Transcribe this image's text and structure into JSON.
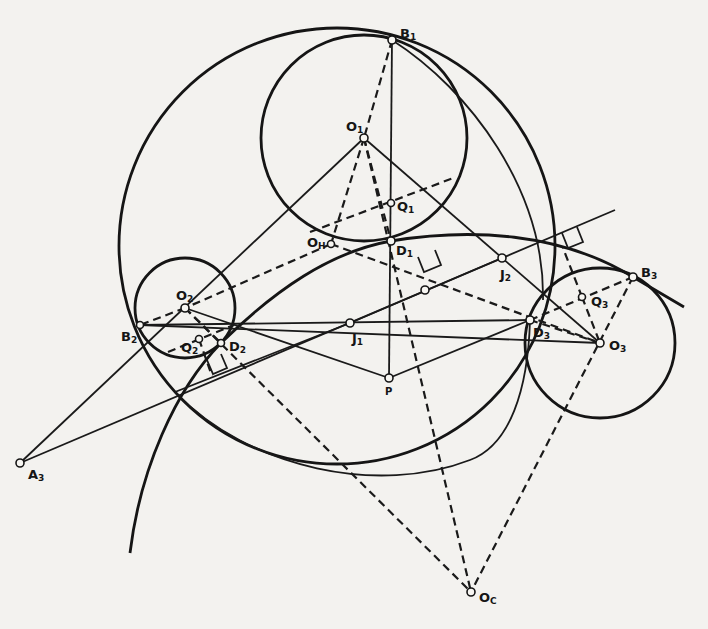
{
  "figure": {
    "type": "geometric construction"
  },
  "labels": {
    "B1": {
      "base": "B",
      "sub": "1"
    },
    "O1": {
      "base": "O",
      "sub": "1"
    },
    "Q1": {
      "base": "Q",
      "sub": "1"
    },
    "D1": {
      "base": "D",
      "sub": "1"
    },
    "OH": {
      "base": "O",
      "sub": "H"
    },
    "O2": {
      "base": "O",
      "sub": "2"
    },
    "B2": {
      "base": "B",
      "sub": "2"
    },
    "Q2": {
      "base": "Q",
      "sub": "2"
    },
    "D2": {
      "base": "D",
      "sub": "2"
    },
    "J1": {
      "base": "J",
      "sub": "1"
    },
    "J2": {
      "base": "J",
      "sub": "2"
    },
    "P": {
      "base": "P",
      "sub": ""
    },
    "D3": {
      "base": "D",
      "sub": "3"
    },
    "O3": {
      "base": "O",
      "sub": "3"
    },
    "Q3": {
      "base": "Q",
      "sub": "3"
    },
    "B3": {
      "base": "B",
      "sub": "3"
    },
    "A3": {
      "base": "A",
      "sub": "3"
    },
    "OC": {
      "base": "O",
      "sub": "C"
    }
  },
  "points": {
    "B1": [
      392,
      40
    ],
    "O1": [
      364,
      138
    ],
    "Q1": [
      391,
      203
    ],
    "D1": [
      391,
      241
    ],
    "OH": [
      331,
      244
    ],
    "O2": [
      185,
      308
    ],
    "B2": [
      140,
      325
    ],
    "Q2": [
      199,
      339
    ],
    "D2": [
      221,
      343
    ],
    "J1": [
      350,
      323
    ],
    "J2": [
      502,
      258
    ],
    "P": [
      389,
      378
    ],
    "D3": [
      530,
      320
    ],
    "O3": [
      600,
      343
    ],
    "Q3": [
      582,
      297
    ],
    "B3": [
      633,
      277
    ],
    "A3": [
      20,
      463
    ],
    "OC": [
      471,
      592
    ],
    "X": [
      425,
      290
    ]
  },
  "circles": {
    "outer": {
      "cx": 337,
      "cy": 246,
      "r": 218
    },
    "c1": {
      "cx": 364,
      "cy": 138,
      "r": 103
    },
    "c2": {
      "cx": 185,
      "cy": 308,
      "r": 50
    },
    "c3": {
      "cx": 600,
      "cy": 343,
      "r": 75
    }
  }
}
